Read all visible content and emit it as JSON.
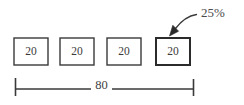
{
  "diagram": {
    "type": "bar-segment-dimension-diagram",
    "background_color": "#ffffff",
    "line_color": "#3a3a3a",
    "accent_color": "#2b2b2b",
    "text_color": "#3a3a3a",
    "boxes": [
      {
        "label": "20",
        "x": 14,
        "y": 38,
        "w": 34,
        "h": 27,
        "emphasis": false
      },
      {
        "label": "20",
        "x": 60,
        "y": 38,
        "w": 34,
        "h": 27,
        "emphasis": false
      },
      {
        "label": "20",
        "x": 107,
        "y": 38,
        "w": 34,
        "h": 27,
        "emphasis": false
      },
      {
        "label": "20",
        "x": 156,
        "y": 38,
        "w": 34,
        "h": 27,
        "emphasis": true
      }
    ],
    "callout": {
      "label": "25%",
      "label_x": 201,
      "label_y": 14,
      "arrow_tip_x": 171,
      "arrow_tip_y": 35,
      "arrow_tail_x": 196,
      "arrow_tail_y": 15
    },
    "dimension": {
      "label": "80",
      "label_x": 101,
      "label_y": 88,
      "line_y": 89,
      "start_x": 15,
      "end_x": 194,
      "tick_top": 78,
      "tick_bottom": 96
    }
  }
}
